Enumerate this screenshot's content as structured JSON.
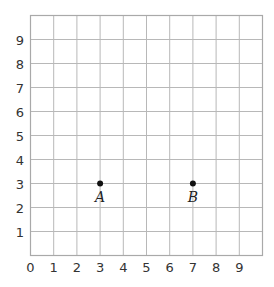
{
  "chart_data": {
    "type": "scatter",
    "title": "",
    "xlabel": "",
    "ylabel": "",
    "xlim": [
      0,
      10
    ],
    "ylim": [
      0,
      10
    ],
    "grid": true,
    "x_ticks": [
      "0",
      "1",
      "2",
      "3",
      "4",
      "5",
      "6",
      "7",
      "8",
      "9"
    ],
    "y_ticks": [
      "1",
      "2",
      "3",
      "4",
      "5",
      "6",
      "7",
      "8",
      "9"
    ],
    "points": [
      {
        "label": "A",
        "x": 3,
        "y": 3
      },
      {
        "label": "B",
        "x": 7,
        "y": 3
      }
    ]
  },
  "colors": {
    "grid": "#b8b8b8",
    "point": "#111111",
    "text": "#333333"
  }
}
